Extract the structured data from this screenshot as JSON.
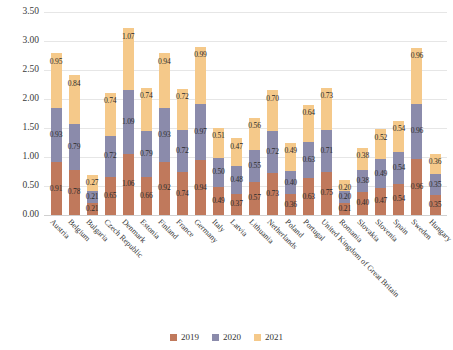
{
  "chart_data": {
    "type": "bar",
    "stacked": true,
    "title": "",
    "xlabel": "",
    "ylabel": "",
    "ylim": [
      0,
      3.5
    ],
    "ytick_step": 0.5,
    "ytick_labels": [
      "0.00",
      "0.50",
      "1.00",
      "1.50",
      "2.00",
      "2.50",
      "3.00",
      "3.50"
    ],
    "ytick_values": [
      0,
      0.5,
      1.0,
      1.5,
      2.0,
      2.5,
      3.0,
      3.5
    ],
    "grid": true,
    "legend_position": "bottom",
    "categories": [
      "Austria",
      "Belgium",
      "Bulgaria",
      "Czech Republic",
      "Denmark",
      "Estonia",
      "Finland",
      "France",
      "Germany",
      "Italy",
      "Latvia",
      "Lithuania",
      "Netherlands",
      "Poland",
      "Portugal",
      "United Kingdom of Great Britain",
      "Romania",
      "Slovakia",
      "Slovenia",
      "Spain",
      "Sweden",
      "Hungary"
    ],
    "series": [
      {
        "name": "2019",
        "color": "#c0795c",
        "values": [
          0.91,
          0.78,
          0.21,
          0.65,
          1.06,
          0.66,
          0.92,
          0.74,
          0.94,
          0.49,
          0.37,
          0.57,
          0.73,
          0.36,
          0.63,
          0.75,
          0.21,
          0.4,
          0.47,
          0.54,
          0.96,
          0.35
        ],
        "labels": [
          "0.91",
          "0.78",
          "0.21",
          "0.65",
          "1.06",
          "0.66",
          "0.92",
          "0.74",
          "0.94",
          "0.49",
          "0.37",
          "0.57",
          "0.73",
          "0.36",
          "0.63",
          "0.75",
          "0.21",
          "0.40",
          "0.47",
          "0.54",
          "0.96",
          "0.35"
        ]
      },
      {
        "name": "2020",
        "color": "#8b8bab",
        "values": [
          0.93,
          0.79,
          0.21,
          0.72,
          1.09,
          0.79,
          0.93,
          0.72,
          0.97,
          0.5,
          0.48,
          0.55,
          0.72,
          0.4,
          0.63,
          0.71,
          0.2,
          0.38,
          0.49,
          0.54,
          0.96,
          0.35
        ],
        "labels": [
          "0.93",
          "0.79",
          "0.21",
          "0.72",
          "1.09",
          "0.79",
          "0.93",
          "0.72",
          "0.97",
          "0.50",
          "0.48",
          "0.55",
          "0.72",
          "0.40",
          "0.63",
          "0.71",
          "0.20",
          "0.38",
          "0.49",
          "0.54",
          "0.96",
          "0.35"
        ]
      },
      {
        "name": "2021",
        "color": "#f5c98a",
        "values": [
          0.95,
          0.84,
          0.27,
          0.74,
          1.07,
          0.74,
          0.94,
          0.72,
          0.99,
          0.51,
          0.47,
          0.56,
          0.7,
          0.49,
          0.64,
          0.73,
          0.2,
          0.38,
          0.52,
          0.54,
          0.96,
          0.36
        ],
        "labels": [
          "0.95",
          "0.84",
          "0.27",
          "0.74",
          "1.07",
          "0.74",
          "0.94",
          "0.72",
          "0.99",
          "0.51",
          "0.47",
          "0.56",
          "0.70",
          "0.49",
          "0.64",
          "0.73",
          "0.20",
          "0.38",
          "0.52",
          "0.54",
          "0.96",
          "0.36"
        ]
      }
    ]
  },
  "legend": {
    "items": [
      {
        "label": "2019",
        "color": "#c0795c"
      },
      {
        "label": "2020",
        "color": "#8b8bab"
      },
      {
        "label": "2021",
        "color": "#f5c98a"
      }
    ]
  }
}
